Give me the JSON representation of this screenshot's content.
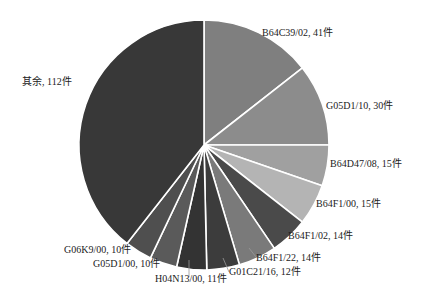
{
  "chart_data": {
    "type": "pie",
    "title": "",
    "unit": "件",
    "start_angle_deg": 0,
    "direction": "clockwise",
    "slices": [
      {
        "label": "B64C39/02",
        "value": 41,
        "text": "B64C39/02, 41件",
        "color": "#7f7f7f"
      },
      {
        "label": "G05D1/10",
        "value": 30,
        "text": "G05D1/10, 30件",
        "color": "#8c8c8c"
      },
      {
        "label": "B64D47/08",
        "value": 15,
        "text": "B64D47/08, 15件",
        "color": "#a0a0a0"
      },
      {
        "label": "B64F1/00",
        "value": 15,
        "text": "B64F1/00, 15件",
        "color": "#b4b4b4"
      },
      {
        "label": "B64F1/02",
        "value": 14,
        "text": "B64F1/02, 14件",
        "color": "#4a4a4a"
      },
      {
        "label": "B64F1/22",
        "value": 14,
        "text": "B64F1/22, 14件",
        "color": "#7a7a7a"
      },
      {
        "label": "G01C21/16",
        "value": 12,
        "text": "G01C21/16, 12件",
        "color": "#3c3c3c"
      },
      {
        "label": "H04N13/00",
        "value": 11,
        "text": "H04N13/00, 11件",
        "color": "#333333"
      },
      {
        "label": "G05D1/00",
        "value": 10,
        "text": "G05D1/00, 10件",
        "color": "#5a5a5a"
      },
      {
        "label": "G06K9/00",
        "value": 10,
        "text": "G06K9/00, 10件",
        "color": "#4f4f4f"
      },
      {
        "label": "其余",
        "value": 112,
        "text": "其余, 112件",
        "color": "#383838"
      }
    ],
    "total": 284,
    "legend": "none (direct labels)"
  },
  "geometry": {
    "cx": 204,
    "cy": 145,
    "r": 125
  },
  "labels": [
    {
      "key": "B64C39/02",
      "x": 262,
      "y": 36,
      "anchor": "start",
      "leader": null
    },
    {
      "key": "G05D1/10",
      "x": 326,
      "y": 109,
      "anchor": "start",
      "leader": null
    },
    {
      "key": "B64D47/08",
      "x": 330,
      "y": 167,
      "anchor": "start",
      "leader": null
    },
    {
      "key": "B64F1/00",
      "x": 316,
      "y": 207,
      "anchor": "start",
      "leader": null
    },
    {
      "key": "B64F1/02",
      "x": 288,
      "y": 239,
      "anchor": "start",
      "leader": null
    },
    {
      "key": "B64F1/22",
      "x": 256,
      "y": 261,
      "anchor": "start",
      "leader": [
        [
          249,
          248
        ],
        [
          256,
          257
        ]
      ]
    },
    {
      "key": "G01C21/16",
      "x": 229,
      "y": 275,
      "anchor": "start",
      "leader": [
        [
          223,
          258
        ],
        [
          229,
          272
        ]
      ]
    },
    {
      "key": "H04N13/00",
      "x": 155,
      "y": 282,
      "anchor": "start",
      "leader": [
        [
          189,
          260
        ],
        [
          189,
          277
        ]
      ]
    },
    {
      "key": "G05D1/00",
      "x": 93,
      "y": 267,
      "anchor": "start",
      "leader": null
    },
    {
      "key": "G06K9/00",
      "x": 64,
      "y": 253,
      "anchor": "start",
      "leader": null
    },
    {
      "key": "其余",
      "x": 22,
      "y": 85,
      "anchor": "start",
      "leader": null
    }
  ]
}
